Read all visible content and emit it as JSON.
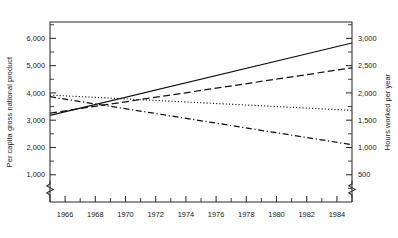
{
  "chart_data": {
    "type": "line",
    "title": "",
    "subtitle": "",
    "xlabel": "",
    "ylabel": "Per capita gross national product",
    "y2label": "Hours worked per year",
    "xlim": [
      1965,
      1985
    ],
    "ylim": [
      0,
      6600
    ],
    "y2lim": [
      0,
      3300
    ],
    "grid": false,
    "legend": "none",
    "axis_break": true,
    "x": [
      1965,
      1985
    ],
    "xticks": [
      1966,
      1968,
      1970,
      1972,
      1974,
      1976,
      1978,
      1980,
      1982,
      1984
    ],
    "xtick_labels": [
      "1966",
      "1968",
      "1970",
      "1972",
      "1974",
      "1976",
      "1978",
      "1980",
      "1982",
      "1984"
    ],
    "xminor_ticks": [
      1965,
      1967,
      1969,
      1971,
      1973,
      1975,
      1977,
      1979,
      1981,
      1983,
      1985
    ],
    "yticks": [
      1000,
      2000,
      3000,
      4000,
      5000,
      6000
    ],
    "ytick_labels": [
      "1,000",
      "2,000",
      "3,000",
      "4,000",
      "5,000",
      "6,000"
    ],
    "yminor_ticks": [
      1500,
      2500,
      3500,
      4500,
      5500,
      6500
    ],
    "y2ticks": [
      500,
      1000,
      1500,
      2000,
      2500,
      3000
    ],
    "y2tick_labels": [
      "500",
      "1,000",
      "1,500",
      "2,000",
      "2,500",
      "3,000"
    ],
    "y2minor_ticks": [
      250,
      750,
      1250,
      1750,
      2250,
      2750,
      3250
    ],
    "series": [
      {
        "name": "gnp-rising-solid",
        "style": "solid",
        "axis": "left",
        "x": [
          1965,
          1985
        ],
        "values": [
          3180,
          5830
        ]
      },
      {
        "name": "gnp-rising-dashed",
        "style": "dashed",
        "axis": "left",
        "x": [
          1965,
          1985
        ],
        "values": [
          3260,
          4920
        ]
      },
      {
        "name": "hours-flat-dotted",
        "style": "dotted",
        "axis": "right",
        "x": [
          1965,
          1985
        ],
        "values": [
          1960,
          1680
        ]
      },
      {
        "name": "hours-falling-dashdot",
        "style": "dashdot",
        "axis": "right",
        "x": [
          1965,
          1985
        ],
        "values": [
          1930,
          1050
        ]
      }
    ]
  }
}
